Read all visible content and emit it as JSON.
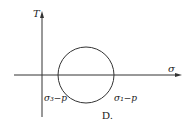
{
  "figure": {
    "option_label": "D.",
    "y_axis_label": "T",
    "x_axis_label": "σ",
    "circle": {
      "left_intercept_label": "σ₃−p",
      "right_intercept_label": "σ₁−p",
      "center_x": 86,
      "center_y": 75,
      "radius": 28
    },
    "colors": {
      "stroke": "#333333",
      "background": "#ffffff"
    }
  }
}
